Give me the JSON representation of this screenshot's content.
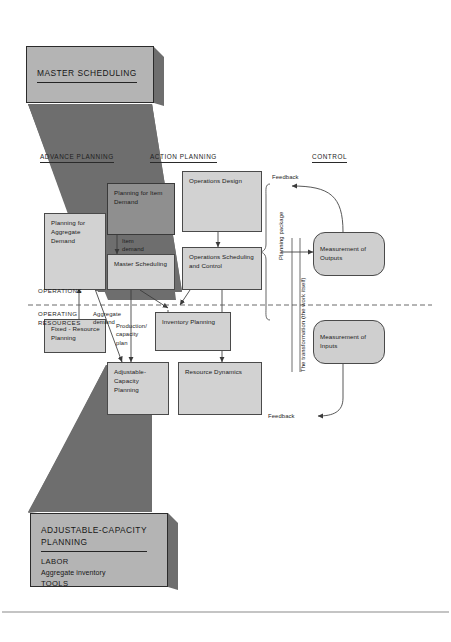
{
  "diagram": {
    "title": "Production planning and control framework",
    "colors": {
      "wedge_fill": "#6e6e6e",
      "box_fill": "#d2d2d2",
      "box_dark_fill": "#8f8f8f",
      "banner_fill": "#b4b4b4",
      "rounded_fill": "#cfcfcf",
      "line": "#4a4a4a",
      "background": "#ffffff"
    }
  },
  "banners": {
    "top": {
      "title": "MASTER SCHEDULING",
      "lines": []
    },
    "bottom": {
      "title_line1": "ADJUSTABLE-CAPACITY",
      "title_line2": "PLANNING",
      "lines": [
        "LABOR",
        "Aggregate inventory",
        "TOOLS"
      ]
    }
  },
  "columns": [
    {
      "label": "ADVANCE PLANNING"
    },
    {
      "label": "ACTION PLANNING"
    },
    {
      "label": "CONTROL"
    }
  ],
  "boxes": [
    {
      "id": "planning-item-demand",
      "label": "Planning for\nItem Demand"
    },
    {
      "id": "planning-aggregate",
      "label": "Planning for\nAggregate\nDemand"
    },
    {
      "id": "master-scheduling",
      "label": "Master\nScheduling"
    },
    {
      "id": "operations-design",
      "label": "Operations Design"
    },
    {
      "id": "operations-scheduling",
      "label": "Operations Scheduling\nand Control"
    },
    {
      "id": "fixed-resource",
      "label": "Fixed - Resource\nPlanning"
    },
    {
      "id": "inventory-planning",
      "label": "Inventory\nPlanning"
    },
    {
      "id": "adjustable-capacity",
      "label": "Adjustable-\nCapacity\nPlanning"
    },
    {
      "id": "resource-dynamics",
      "label": "Resource Dynamics"
    },
    {
      "id": "measurement-outputs",
      "label": "Measurement\nof Outputs"
    },
    {
      "id": "measurement-inputs",
      "label": "Measurement\nof Inputs"
    }
  ],
  "labels": {
    "operations": "OPERATIONS",
    "operating_resources": "OPERATING\nRESOURCES",
    "item_demand": "Item\ndemand",
    "aggregate_demand": "Aggregate\ndemand",
    "production_capacity_plan": "Production/\ncapacity\nplan",
    "planning_package": "Planning\npackage",
    "transformation": "The transformation (the work itself)",
    "feedback_top": "Feedback",
    "feedback_bottom": "Feedback"
  }
}
